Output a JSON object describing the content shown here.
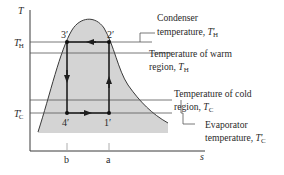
{
  "diagram": {
    "type": "T-s diagram, refrigeration cycle",
    "axes": {
      "y_label": "T",
      "x_label": "s",
      "y_ticks": [
        {
          "main": "T",
          "sub": "H",
          "prime": "′"
        },
        {
          "main": "T",
          "sub": "C",
          "prime": "′"
        }
      ],
      "x_ticks": [
        "b",
        "a"
      ]
    },
    "states": {
      "p1": "1′",
      "p2": "2′",
      "p3": "3′",
      "p4": "4′"
    },
    "annotations": {
      "condenser": {
        "line1": "Condenser",
        "line2_text": "temperature, ",
        "sym": "T",
        "sub": "H",
        "prime": "′"
      },
      "warm": {
        "line1": "Temperature of warm",
        "line2_text": "region, ",
        "sym": "T",
        "sub": "H",
        "prime": ""
      },
      "cold": {
        "line1": "Temperature of cold",
        "line2_text": "region, ",
        "sym": "T",
        "sub": "C",
        "prime": ""
      },
      "evaporator": {
        "line1": "Evaporator",
        "line2_text": "temperature, ",
        "sym": "T",
        "sub": "C",
        "prime": "′"
      }
    },
    "colors": {
      "dome_fill": "#d4d4d4",
      "lines": "#3a3a3a",
      "text": "#2a2a2a"
    }
  }
}
